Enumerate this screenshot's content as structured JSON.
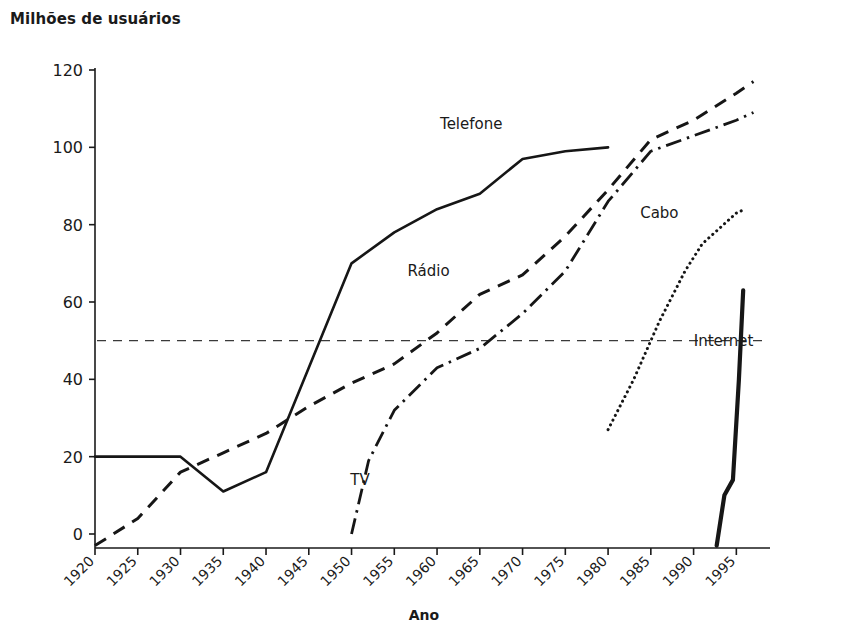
{
  "chart_data": {
    "type": "line",
    "title": "Milhões de usuários",
    "xlabel": "Ano",
    "ylabel": "Milhões de usuários",
    "xlim": [
      1920,
      1998
    ],
    "ylim": [
      -4,
      124
    ],
    "yticks": [
      0,
      20,
      40,
      60,
      80,
      100,
      120
    ],
    "xticks": [
      1920,
      1925,
      1930,
      1935,
      1940,
      1945,
      1950,
      1955,
      1960,
      1965,
      1970,
      1975,
      1980,
      1985,
      1990,
      1995
    ],
    "grid": false,
    "legend_position": "inline-labels",
    "annotations": [
      {
        "text": "Reference line at 50 million users",
        "y": 50,
        "style": "horizontal-dashed"
      }
    ],
    "series": [
      {
        "name": "Telefone",
        "style": "solid",
        "label_x": 1964,
        "label_y": 106,
        "x": [
          1920,
          1925,
          1930,
          1935,
          1940,
          1945,
          1950,
          1955,
          1960,
          1965,
          1970,
          1975,
          1980
        ],
        "values": [
          20,
          20,
          20,
          11,
          16,
          43,
          70,
          78,
          84,
          88,
          97,
          99,
          100
        ]
      },
      {
        "name": "Rádio",
        "style": "dashed",
        "label_x": 1959,
        "label_y": 68,
        "x": [
          1920,
          1925,
          1930,
          1935,
          1940,
          1945,
          1950,
          1955,
          1960,
          1965,
          1970,
          1975,
          1980,
          1985,
          1990,
          1995,
          1997
        ],
        "values": [
          -3,
          4,
          16,
          21,
          26,
          33,
          39,
          44,
          52,
          62,
          67,
          77,
          89,
          102,
          107,
          114,
          117
        ]
      },
      {
        "name": "TV",
        "style": "dash-dot",
        "label_x": 1951,
        "label_y": 14,
        "x": [
          1950,
          1952,
          1955,
          1960,
          1965,
          1970,
          1975,
          1980,
          1985,
          1990,
          1995,
          1997
        ],
        "values": [
          0,
          19,
          32,
          43,
          48,
          57,
          68,
          86,
          99,
          103,
          107,
          109
        ]
      },
      {
        "name": "Cabo",
        "style": "dotted",
        "label_x": 1986,
        "label_y": 83,
        "x": [
          1980,
          1983,
          1986,
          1989,
          1991,
          1993,
          1995,
          1996
        ],
        "values": [
          27,
          40,
          55,
          68,
          75,
          79,
          83,
          84
        ]
      },
      {
        "name": "Internet",
        "style": "thick-solid",
        "label_x": 1993.5,
        "label_y": 50,
        "x": [
          1992.7,
          1993.6,
          1994.6,
          1995.3,
          1995.8
        ],
        "values": [
          -3,
          10,
          14,
          40,
          63
        ]
      }
    ]
  }
}
